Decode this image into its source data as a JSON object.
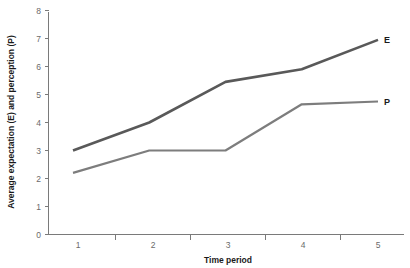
{
  "chart_data": {
    "type": "line",
    "title": "",
    "xlabel": "Time period",
    "ylabel": "Average expectation (E) and perception (P)",
    "categories": [
      "1",
      "2",
      "3",
      "4",
      "5"
    ],
    "x": [
      1,
      2,
      3,
      4,
      5
    ],
    "xlim": [
      0.5,
      5.5
    ],
    "ylim": [
      0,
      8
    ],
    "yticks": [
      "0",
      "1",
      "2",
      "3",
      "4",
      "5",
      "6",
      "7",
      "8"
    ],
    "grid": false,
    "legend_position": "line-end-labels",
    "series": [
      {
        "name": "E",
        "label": "E",
        "description": "Average expectation",
        "color": "#595959",
        "values": [
          3.0,
          4.0,
          5.45,
          5.9,
          6.95
        ]
      },
      {
        "name": "P",
        "label": "P",
        "description": "Average perception",
        "color": "#7d7d7d",
        "values": [
          2.2,
          3.0,
          3.0,
          4.65,
          4.75
        ]
      }
    ],
    "annotations": [
      {
        "text": "E",
        "x": 5,
        "y": 6.95
      },
      {
        "text": "P",
        "x": 5,
        "y": 4.75
      }
    ]
  },
  "axes": {
    "y_tick_labels": [
      "8",
      "7",
      "6",
      "5",
      "4",
      "3",
      "2",
      "1",
      "0"
    ],
    "x_tick_labels": [
      "1",
      "2",
      "3",
      "4",
      "5"
    ],
    "y_axis_title": "Average expectation (E) and perception (P)",
    "x_axis_title": "Time period"
  },
  "colors": {
    "background": "#ffffff",
    "axis": "#7a7a7a",
    "tick_text": "#6b6b6b",
    "title_text": "#1a1a1a",
    "series_e": "#595959",
    "series_p": "#7d7d7d"
  }
}
